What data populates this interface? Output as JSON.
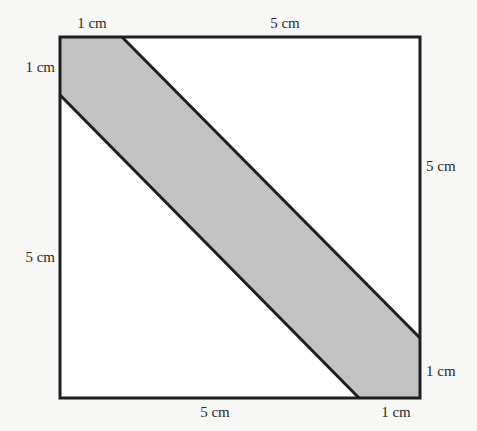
{
  "diagram": {
    "colors": {
      "background": "#f7f7f5",
      "square_fill": "#ffffff",
      "band_fill": "#c2c2c2",
      "stroke": "#1e1e1e",
      "text": "#2a2a2a"
    },
    "labels": {
      "top_left_segment": "1 cm",
      "top_right_segment": "5 cm",
      "left_top_segment": "1 cm",
      "left_bottom_segment": "5 cm",
      "right_top_segment": "5 cm",
      "right_bottom_segment": "1 cm",
      "bottom_left_segment": "5 cm",
      "bottom_right_segment": "1 cm"
    }
  }
}
